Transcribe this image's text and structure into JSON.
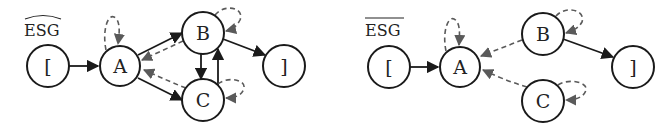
{
  "diagrams": [
    {
      "id": "left",
      "title": "ESG",
      "title_decoration": "widehat",
      "nodes": [
        {
          "id": "start",
          "label": "[",
          "x": 48,
          "y": 66
        },
        {
          "id": "A",
          "label": "A",
          "x": 120,
          "y": 66
        },
        {
          "id": "B",
          "label": "B",
          "x": 203,
          "y": 33
        },
        {
          "id": "C",
          "label": "C",
          "x": 203,
          "y": 100
        },
        {
          "id": "end",
          "label": "]",
          "x": 284,
          "y": 66
        }
      ],
      "solid_edges": [
        {
          "from": "[",
          "to": "A"
        },
        {
          "from": "A",
          "to": "B"
        },
        {
          "from": "A",
          "to": "C"
        },
        {
          "from": "B",
          "to": "C"
        },
        {
          "from": "C",
          "to": "B"
        },
        {
          "from": "B",
          "to": "]"
        }
      ],
      "dashed_edges": [
        {
          "from": "A",
          "to": "A",
          "type": "self-loop"
        },
        {
          "from": "B",
          "to": "A"
        },
        {
          "from": "C",
          "to": "A"
        },
        {
          "from": "B",
          "to": "B",
          "type": "self-loop"
        },
        {
          "from": "C",
          "to": "C",
          "type": "self-loop"
        }
      ]
    },
    {
      "id": "right",
      "title": "ESG",
      "title_decoration": "overline",
      "nodes": [
        {
          "id": "start",
          "label": "[",
          "x": 389,
          "y": 67
        },
        {
          "id": "A",
          "label": "A",
          "x": 460,
          "y": 67
        },
        {
          "id": "B",
          "label": "B",
          "x": 543,
          "y": 34
        },
        {
          "id": "C",
          "label": "C",
          "x": 543,
          "y": 101
        },
        {
          "id": "end",
          "label": "]",
          "x": 633,
          "y": 67
        }
      ],
      "solid_edges": [
        {
          "from": "[",
          "to": "A"
        },
        {
          "from": "B",
          "to": "]"
        }
      ],
      "dashed_edges": [
        {
          "from": "A",
          "to": "A",
          "type": "self-loop"
        },
        {
          "from": "B",
          "to": "A"
        },
        {
          "from": "C",
          "to": "A"
        },
        {
          "from": "B",
          "to": "B",
          "type": "self-loop"
        },
        {
          "from": "C",
          "to": "C",
          "type": "self-loop"
        }
      ]
    }
  ],
  "colors": {
    "solid_edge": "#1a1a1a",
    "dashed_edge": "#5a5a5a",
    "node_stroke": "#1a1a1a",
    "background": "#ffffff"
  }
}
